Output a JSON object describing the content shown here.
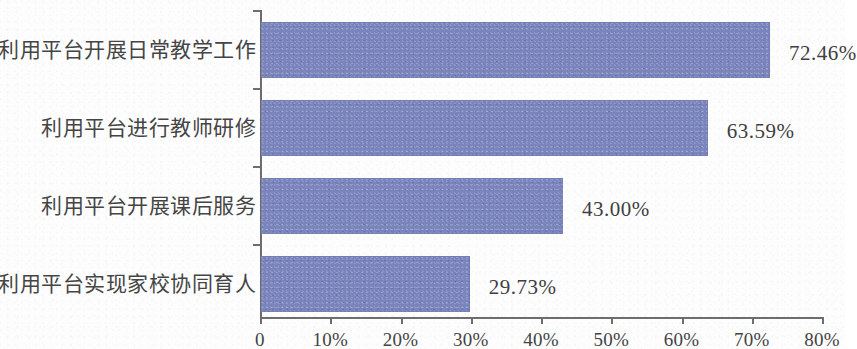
{
  "chart_data": {
    "type": "bar",
    "orientation": "horizontal",
    "title": "",
    "subtitle": "",
    "xlabel": "",
    "ylabel": "",
    "categories": [
      "利用平台开展日常教学工作",
      "利用平台进行教师研修",
      "利用平台开展课后服务",
      "利用平台实现家校协同育人"
    ],
    "values": [
      72.46,
      63.59,
      43.0,
      29.73
    ],
    "value_labels": [
      "72.46%",
      "63.59%",
      "43.00%",
      "29.73%"
    ],
    "xlim": [
      0,
      80
    ],
    "xticks": [
      0,
      10,
      20,
      30,
      40,
      50,
      60,
      70,
      80
    ],
    "xtick_labels": [
      "0",
      "10%",
      "20%",
      "30%",
      "40%",
      "50%",
      "60%",
      "70%",
      "80%"
    ],
    "grid": false,
    "legend": false,
    "bar_color": "#7b85bd",
    "axis_color": "#6e6e6e",
    "background_color": "#fdfdfd"
  }
}
